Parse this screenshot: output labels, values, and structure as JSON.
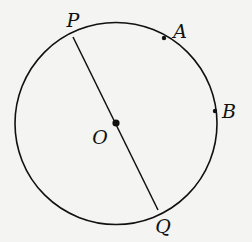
{
  "diagram": {
    "type": "circle-geometry",
    "background": "#f4f4f2",
    "stroke_color": "#111111",
    "circle": {
      "center": "O",
      "cx": 116,
      "cy": 123.5,
      "r": 101
    },
    "segments": [
      {
        "from": "P",
        "to": "Q",
        "label": "PQ",
        "is_diameter": true
      }
    ],
    "points": [
      {
        "id": "P",
        "label": "P",
        "x": 73,
        "y": 37,
        "dot": false,
        "lx": 73,
        "ly": 27
      },
      {
        "id": "A",
        "label": "A",
        "x": 164,
        "y": 38,
        "dot": true,
        "lx": 180,
        "ly": 38
      },
      {
        "id": "B",
        "label": "B",
        "x": 215,
        "y": 111,
        "dot": true,
        "lx": 229,
        "ly": 118
      },
      {
        "id": "O",
        "label": "O",
        "x": 116,
        "y": 123,
        "dot": true,
        "lx": 100,
        "ly": 144
      },
      {
        "id": "Q",
        "label": "Q",
        "x": 158,
        "y": 210,
        "dot": false,
        "lx": 163,
        "ly": 233
      }
    ]
  }
}
